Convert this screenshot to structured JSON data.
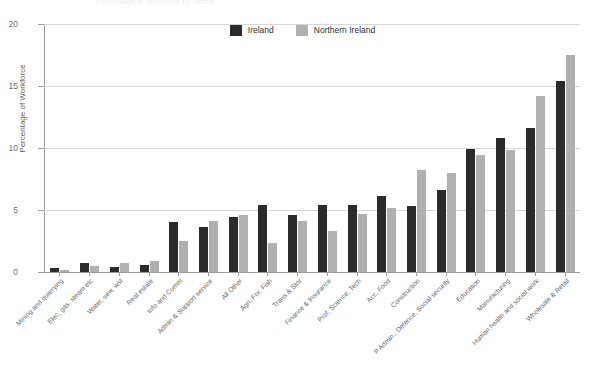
{
  "faint_title": "Percentage of Workforce by Sector",
  "legend": {
    "position": "top-center",
    "entries": [
      {
        "label": "Ireland",
        "color": "#2b2b2b"
      },
      {
        "label": "Northern Ireland",
        "color": "#b0b0b0"
      }
    ]
  },
  "chart_data": {
    "type": "bar",
    "title": "",
    "xlabel": "",
    "ylabel": "Percentage of Workforce",
    "ylim": [
      0,
      20
    ],
    "yticks": [
      0,
      5,
      10,
      15,
      20
    ],
    "ytick_labels": [
      "0",
      "5",
      "10",
      "15",
      "20"
    ],
    "grid": true,
    "grid_axis": "y",
    "legend_position": "top-center",
    "categories": [
      "Mining and quarrying",
      "Elec, gas, steam etc",
      "Water, sew, wst",
      "Real estate",
      "Info and Comm",
      "Admin & Support service",
      "All Other",
      "Agri, For, Fish",
      "Trans & Stor",
      "Finance & Insurance",
      "Prof, Science, Tech",
      "Acc, Food",
      "Construction",
      "P Admin., Defence, Social security",
      "Education",
      "Manufacturing",
      "Human health and social work",
      "Wholesale & Retail"
    ],
    "series": [
      {
        "name": "Ireland",
        "color": "#2b2b2b",
        "values": [
          0.3,
          0.7,
          0.4,
          0.6,
          4.0,
          3.6,
          4.4,
          5.4,
          4.6,
          5.4,
          5.4,
          6.1,
          5.3,
          6.6,
          9.9,
          10.8,
          11.6,
          15.4
        ]
      },
      {
        "name": "Northern Ireland",
        "color": "#b0b0b0",
        "values": [
          0.2,
          0.5,
          0.7,
          0.9,
          2.5,
          4.1,
          4.6,
          2.3,
          4.1,
          3.3,
          4.7,
          5.2,
          8.2,
          8.0,
          9.4,
          9.8,
          14.2,
          17.5
        ]
      }
    ]
  }
}
